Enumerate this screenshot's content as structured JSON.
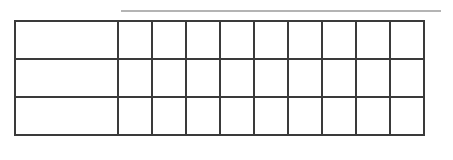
{
  "top_rule": {
    "color": "#b4b4b4"
  },
  "table": {
    "border_color": "#3a3a3a",
    "columns": 10,
    "rows": [
      {
        "label": "",
        "cells": [
          "",
          "",
          "",
          "",
          "",
          "",
          "",
          "",
          ""
        ]
      },
      {
        "label": "",
        "cells": [
          "",
          "",
          "",
          "",
          "",
          "",
          "",
          "",
          ""
        ]
      },
      {
        "label": "",
        "cells": [
          "",
          "",
          "",
          "",
          "",
          "",
          "",
          "",
          ""
        ]
      }
    ]
  }
}
